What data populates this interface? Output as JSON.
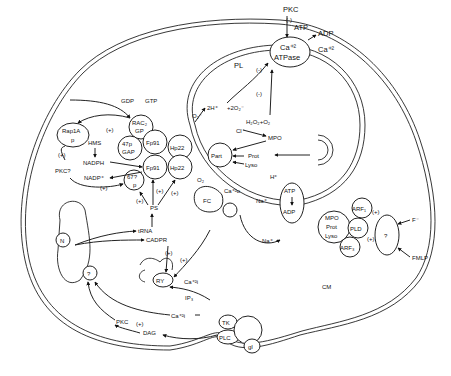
{
  "diagram": {
    "membrane": {
      "plasma_membrane_label": "CM",
      "phagosome_membrane_label": "PL"
    },
    "receptors": {
      "unknown_receptor": "?",
      "ligands": [
        "F⁻",
        "FMLP"
      ],
      "g_protein": "gI",
      "kinase": "TK",
      "phospholipase_c": "PLC"
    },
    "ca_atpase": {
      "line1": "Ca⁺²",
      "line2": "ATPase",
      "regulator": "PKC",
      "regulation": "(-)",
      "input": "ATP",
      "outputs": [
        "ADP",
        "Ca⁺²"
      ]
    },
    "nadph_oxidase": {
      "rac": {
        "line1": "RAC₂",
        "line2": "GP"
      },
      "gdp": "GDP",
      "gtp": "GTP",
      "p47": {
        "line1": "47p",
        "line2": "GAP"
      },
      "p67": {
        "line1": "67?",
        "line2": "p"
      },
      "fp91_top": "Fp91",
      "fp91_bottom": "Fp91",
      "hp22_top": "Hp22",
      "hp22_bottom": "Hp22",
      "rap1a": {
        "line1": "Rap1A",
        "line2": "p"
      }
    },
    "metabolism": {
      "hms": "HMS",
      "nadph": "NADPH",
      "nadp": "NADP⁺",
      "pkc_q": "PKC?",
      "ps": "PS"
    },
    "ros": {
      "superoxide": "O₂⁻",
      "oxygen": "O₂",
      "protons": "2H⁺",
      "two_superoxide": "+2O₂⁻",
      "peroxide": "H₂O₂+O₂",
      "chloride": "Cl⁻",
      "mpo": "MPO"
    },
    "granules": {
      "particle": "Part",
      "prot": "Prot",
      "lyso": "Lyso",
      "h_plus": "H⁺",
      "fc": "FC",
      "ca_out": "Ca⁺²o",
      "na_in": "Na⁺",
      "na_out": "Na⁺",
      "atp": "ATP",
      "adp": "ADP"
    },
    "granule_complex": {
      "line1": "MPO",
      "line2": "Prot",
      "line3": "Lyso",
      "pld": "PLD",
      "arf1": "ARF₁",
      "arf3": "ARF₃"
    },
    "nucleus": {
      "label": "N",
      "unknown": "?",
      "trna": "tRNA",
      "cadpr": "CADPR"
    },
    "calcium": {
      "ry": "RY",
      "ca_i_top": "Ca⁺²i",
      "ca_i_mid": "Ca⁺²i",
      "ip3": "IP₃",
      "pkc": "PKC",
      "dag": "DAG"
    },
    "regulators": {
      "plus": "(+)",
      "minus": "(-)"
    }
  }
}
